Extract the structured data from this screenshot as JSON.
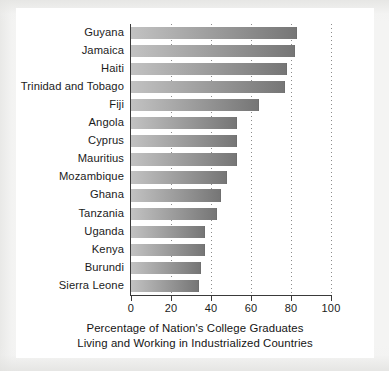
{
  "chart_data": {
    "type": "bar",
    "orientation": "horizontal",
    "title": "",
    "xlabel": "Percentage of Nation's College Graduates Living and Working in Industrialized Countries",
    "ylabel": "",
    "xlim": [
      0,
      100
    ],
    "xticks": [
      "0",
      "20",
      "40",
      "60",
      "80",
      "100"
    ],
    "gridlines": [
      "20",
      "40",
      "60",
      "80",
      "100"
    ],
    "grid": true,
    "legend": "none",
    "categories": [
      "Guyana",
      "Jamaica",
      "Haiti",
      "Trinidad and Tobago",
      "Fiji",
      "Angola",
      "Cyprus",
      "Mauritius",
      "Mozambique",
      "Ghana",
      "Tanzania",
      "Uganda",
      "Kenya",
      "Burundi",
      "Sierra Leone"
    ],
    "values": [
      83,
      82,
      78,
      77,
      64,
      53,
      53,
      53,
      48,
      45,
      43,
      37,
      37,
      35,
      34
    ],
    "bar_gradient_start": "#c2c2c2",
    "bar_gradient_end": "#767676",
    "axis_color": "#3a3a3a",
    "grid_color": "#8c8c8c",
    "background": "#ffffff"
  },
  "caption": {
    "line1": "Percentage of Nation's College Graduates",
    "line2": "Living and Working in Industrialized Countries"
  }
}
